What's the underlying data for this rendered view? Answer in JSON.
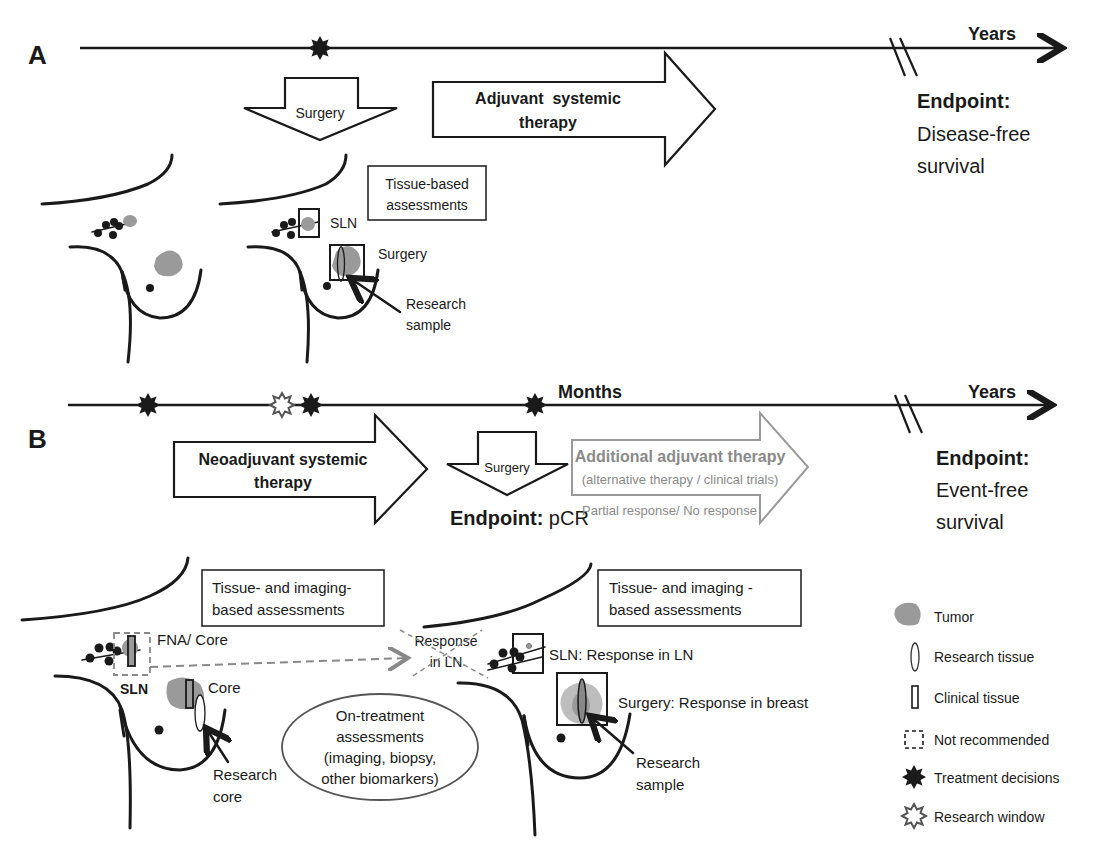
{
  "panel_a": {
    "label": "A",
    "timeline_unit": "Years",
    "surgery_arrow": "Surgery",
    "adjuvant_arrow": [
      "Adjuvant  systemic",
      "therapy"
    ],
    "endpoint_label": "Endpoint:",
    "endpoint_value": [
      "Disease-free",
      "survival"
    ],
    "assessment_box": [
      "Tissue-based",
      "assessments"
    ],
    "sln_label": "SLN",
    "surgery_label": "Surgery",
    "research_sample": [
      "Research",
      "sample"
    ]
  },
  "panel_b": {
    "label": "B",
    "timeline_unit_months": "Months",
    "timeline_unit_years": "Years",
    "neoadjuvant_arrow": [
      "Neoadjuvant systemic",
      "therapy"
    ],
    "surgery_arrow": "Surgery",
    "endpoint_pcr_label": "Endpoint:",
    "endpoint_pcr_value": " pCR",
    "additional_arrow_title": "Additional adjuvant therapy",
    "additional_arrow_sub": "(alternative therapy / clinical trials)",
    "partial_response": "Partial response/ No response",
    "endpoint_label": "Endpoint:",
    "endpoint_value": [
      "Event-free",
      "survival"
    ],
    "pre_assessment_box": [
      "Tissue- and imaging-",
      "based assessments"
    ],
    "post_assessment_box": [
      "Tissue- and imaging -",
      "based assessments"
    ],
    "fna_core": "FNA/ Core",
    "sln_label": "SLN",
    "core_label": "Core",
    "research_core": [
      "Research",
      "core"
    ],
    "response_in_ln_crossed": [
      "Response",
      "in LN"
    ],
    "on_treatment": [
      "On-treatment",
      "assessments",
      "(imaging, biopsy,",
      "other biomarkers)"
    ],
    "sln_response": "SLN: Response in LN",
    "surgery_response": "Surgery: Response in breast",
    "research_sample": [
      "Research",
      "sample"
    ]
  },
  "legend": {
    "items": [
      {
        "icon": "tumor-icon",
        "label": "Tumor"
      },
      {
        "icon": "research-tissue-icon",
        "label": "Research tissue"
      },
      {
        "icon": "clinical-tissue-icon",
        "label": "Clinical tissue"
      },
      {
        "icon": "not-recommended-icon",
        "label": "Not recommended"
      },
      {
        "icon": "treatment-decision-star-icon",
        "label": "Treatment decisions"
      },
      {
        "icon": "research-window-star-icon",
        "label": "Research window"
      }
    ]
  },
  "colors": {
    "line": "#1a1a1a",
    "tumor": "#9a9a9a",
    "faded": "#8a8a8a",
    "dashed": "#888888"
  }
}
